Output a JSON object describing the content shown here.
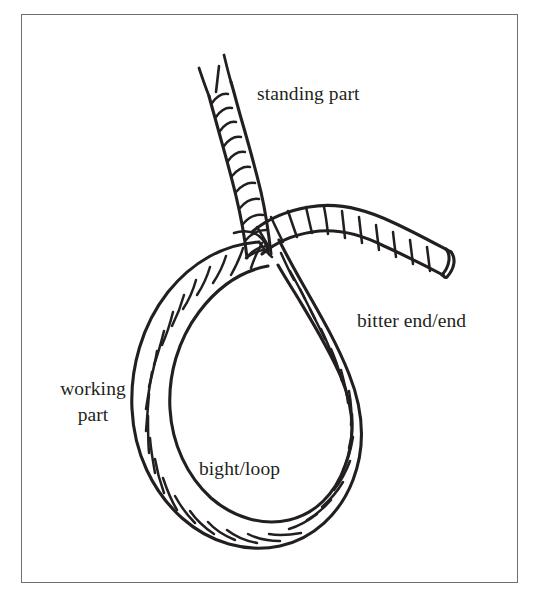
{
  "figure": {
    "kind": "line-art-diagram",
    "background_color": "#ffffff",
    "ink_color": "#231f20",
    "frame": {
      "border_color": "#6f6f6f",
      "border_width_px": 1,
      "x": 21,
      "y": 14,
      "width": 497,
      "height": 569
    }
  },
  "labels": {
    "standing_part": "standing part",
    "bitter_end": "bitter end/end",
    "bight_loop": "bight/loop",
    "working_part_line1": "working",
    "working_part_line2": "part"
  },
  "rope": {
    "stroke_color": "#231f20",
    "outline_width_px": 3.2,
    "strand_width_px": 2.6,
    "rope_thickness_px": 26,
    "parts": [
      "standing-part-rising-to-upper-left",
      "bight-loop-teardrop",
      "bitter-end-exiting-to-right",
      "crossing-point-at-top-of-loop",
      "frayed-tip-at-top-of-standing-part",
      "cut-blunt-tip-at-bitter-end"
    ]
  }
}
